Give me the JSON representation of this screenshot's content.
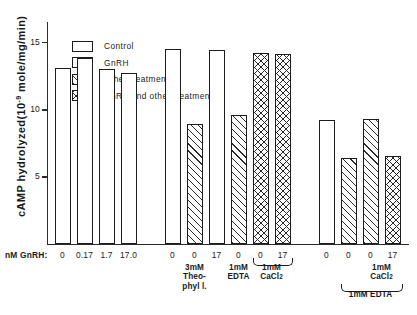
{
  "chart_data": {
    "type": "bar",
    "title": "",
    "xlabel": "nM GnRH:",
    "ylabel": "cAMP hydrolyzed(10-9 mole/mg/min)",
    "ylabel_prefix": "cAMP hydrolyzed(10",
    "ylabel_exponent": "-9",
    "ylabel_suffix": " mole/mg/min)",
    "ylim": [
      0,
      16.5
    ],
    "yticks": [
      5,
      10,
      15
    ],
    "ytick_labels": [
      "5",
      "10",
      "15"
    ],
    "grid": false,
    "legend_position": "top-left",
    "legend": [
      {
        "key": "control",
        "label": "Control",
        "pattern": "dotted"
      },
      {
        "key": "gnrh",
        "label": "GnRH",
        "pattern": "empty"
      },
      {
        "key": "other",
        "label": "Other  treatments",
        "pattern": "diagonal-hatch"
      },
      {
        "key": "both",
        "label": "GnRH and other treatments",
        "pattern": "cross-hatch"
      }
    ],
    "bars": [
      {
        "x": 0,
        "label": "0",
        "value": 13.1,
        "series": "control"
      },
      {
        "x": 1,
        "label": "0.17",
        "value": 13.8,
        "series": "gnrh"
      },
      {
        "x": 2,
        "label": "1.7",
        "value": 13.0,
        "series": "gnrh"
      },
      {
        "x": 3,
        "label": "17.0",
        "value": 12.7,
        "series": "gnrh"
      },
      {
        "x": 5,
        "label": "0",
        "value": 14.5,
        "series": "control"
      },
      {
        "x": 6,
        "label": "0",
        "value": 8.9,
        "series": "other"
      },
      {
        "x": 7,
        "label": "17",
        "value": 14.4,
        "series": "gnrh"
      },
      {
        "x": 8,
        "label": "0",
        "value": 9.6,
        "series": "other"
      },
      {
        "x": 9,
        "label": "0",
        "value": 14.2,
        "series": "both"
      },
      {
        "x": 10,
        "label": "17",
        "value": 14.1,
        "series": "both"
      },
      {
        "x": 12,
        "label": "0",
        "value": 9.2,
        "series": "control"
      },
      {
        "x": 13,
        "label": "0",
        "value": 6.4,
        "series": "other"
      },
      {
        "x": 14,
        "label": "0",
        "value": 9.3,
        "series": "other"
      },
      {
        "x": 15,
        "label": "17",
        "value": 6.5,
        "series": "both"
      }
    ],
    "group_annotations": [
      {
        "key": "theophyll",
        "lines": [
          "3mM",
          "Theo-",
          "phyl l."
        ],
        "bracket": "none"
      },
      {
        "key": "edta1",
        "lines": [
          "1mM",
          "EDTA"
        ],
        "bracket": "none"
      },
      {
        "key": "cacl2a",
        "lines": [
          "1mM",
          "CaCl2"
        ],
        "bracket": "over",
        "bracket_span": "0,17"
      },
      {
        "key": "cacl2b",
        "lines": [
          "1mM",
          "CaCl2"
        ],
        "bracket": "none"
      },
      {
        "key": "edta2",
        "lines": [
          "1mM EDTA"
        ],
        "bracket": "over",
        "bracket_span": "0,0,17"
      }
    ]
  }
}
